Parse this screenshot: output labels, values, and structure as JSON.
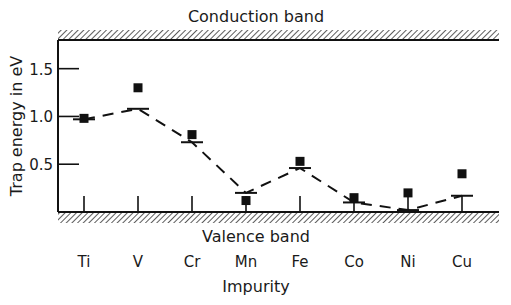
{
  "chart_data": {
    "type": "scatter",
    "title": "",
    "top_band_label": "Conduction band",
    "bottom_band_label": "Valence band",
    "xlabel": "Impurity",
    "ylabel": "Trap energy in eV",
    "categories": [
      "Ti",
      "V",
      "Cr",
      "Mn",
      "Fe",
      "Co",
      "Ni",
      "Cu"
    ],
    "ylim": [
      0,
      1.8
    ],
    "yticks": [
      0.5,
      1.0,
      1.5
    ],
    "ytick_labels": [
      "0.5",
      "1.0",
      "1.5"
    ],
    "grid": false,
    "legend": "none",
    "series": [
      {
        "name": "Measured (squares)",
        "marker": "square",
        "values": [
          0.98,
          1.3,
          0.81,
          0.12,
          0.53,
          0.15,
          0.2,
          0.4
        ]
      },
      {
        "name": "Calculated level (bars)",
        "marker": "hbar",
        "values": [
          0.97,
          1.08,
          0.73,
          0.2,
          0.46,
          0.1,
          0.02,
          0.17
        ]
      }
    ],
    "trend_line": {
      "style": "dashed",
      "follows": "Calculated level (bars)"
    }
  }
}
